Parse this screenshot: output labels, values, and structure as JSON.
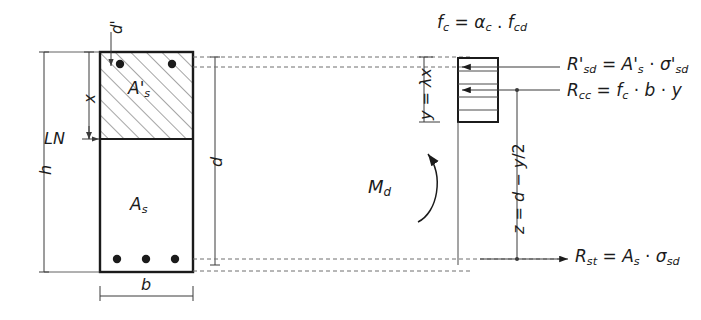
{
  "diagram": {
    "colors": {
      "line": "#1b1b1b",
      "thin": "#4a4a4a",
      "hatch": "#5a5a5a",
      "dashed": "#6e6e6e",
      "text": "#1b1b1b",
      "background": "#ffffff"
    }
  },
  "section": {
    "compression_zone_label": "A'",
    "compression_zone_sub": "s",
    "tension_zone_label": "A",
    "tension_zone_sub": "s",
    "top_rebar_count": 2,
    "bottom_rebar_count": 3
  },
  "dimensions": {
    "overall_height": "h",
    "effective_depth": "d",
    "cover_top": "d'",
    "width": "b",
    "neutral_axis_depth": "x",
    "neutral_axis_label": "LN"
  },
  "stress_block": {
    "concrete_strength_formula": "f_c = α_c · f_cd",
    "concrete_strength_parts": {
      "f": "f",
      "f_sub": "c",
      "eq": "=",
      "alpha": "α",
      "alpha_sub": "c",
      "dot": ".",
      "f2": "f",
      "f2_sub": "cd"
    },
    "depth_label_parts": {
      "y": "y",
      "eq": "=",
      "lambda": "λ",
      "x": "x"
    },
    "depth_label": "y = λx",
    "depth_tick_label": "y",
    "lever_arm_parts": {
      "z": "z",
      "eq": "=",
      "d": "d",
      "minus": "−",
      "y": "y",
      "slash": "/2"
    },
    "lever_arm_label": "z = d − y/2"
  },
  "forces": {
    "compression_steel": {
      "name": "R'_sd",
      "parts": {
        "R": "R",
        "prime": "'",
        "R_sub": "sd",
        "eq": "=",
        "A": "A",
        "A_prime": "'",
        "A_sub": "s",
        "dot": "·",
        "sigma": "σ",
        "sigma_prime": "'",
        "sigma_sub": "sd"
      },
      "text": "R'sd = A's · σ'sd"
    },
    "concrete": {
      "name": "R_cc",
      "parts": {
        "R": "R",
        "R_sub": "cc",
        "eq": "=",
        "f": "f",
        "f_sub": "c",
        "dot1": "·",
        "b": "b",
        "dot2": "·",
        "y": "y"
      },
      "text": "Rcc = fc · b · y"
    },
    "tension_steel": {
      "name": "R_st",
      "parts": {
        "R": "R",
        "R_sub": "st",
        "eq": "=",
        "A": "A",
        "A_sub": "s",
        "dot": "·",
        "sigma": "σ",
        "sigma_sub": "sd"
      },
      "text": "Rst = As · σsd"
    },
    "design_moment": {
      "parts": {
        "M": "M",
        "M_sub": "d"
      },
      "text": "Md"
    }
  }
}
